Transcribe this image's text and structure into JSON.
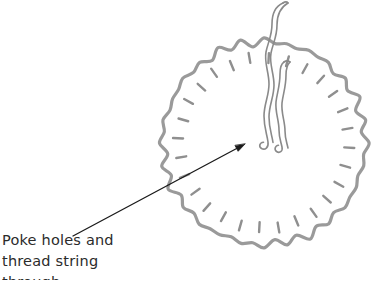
{
  "figure": {
    "colors": {
      "disc_outline": "#9a9a9a",
      "stitch_dash": "#8f8f8f",
      "string": "#8a8a8a",
      "arrow": "#1a1a1a",
      "text": "#2b2b2b",
      "background": "#ffffff"
    },
    "disc": {
      "name": "scalloped-fabric-disc",
      "center_x": 264,
      "center_y": 143,
      "radius": 104,
      "scallop_count": 28,
      "scallop_depth": 5,
      "stroke_width": 3.2
    },
    "stitch_marks": {
      "name": "radial-stitch-dashes",
      "count": 28,
      "inner_radius": 80,
      "outer_radius": 90,
      "stroke_width": 2.4
    },
    "string": {
      "name": "threaded-string",
      "strand_count": 2,
      "stroke_width": 1.6,
      "exits_top": true,
      "knot_ends_y": 148
    },
    "arrow": {
      "name": "pointer-arrow",
      "tail_x": 73,
      "tail_y": 236,
      "tip_x": 245,
      "tip_y": 144,
      "stroke_width": 1.3
    }
  },
  "caption": {
    "lines": [
      "Poke holes and",
      "thread string",
      "through"
    ]
  }
}
